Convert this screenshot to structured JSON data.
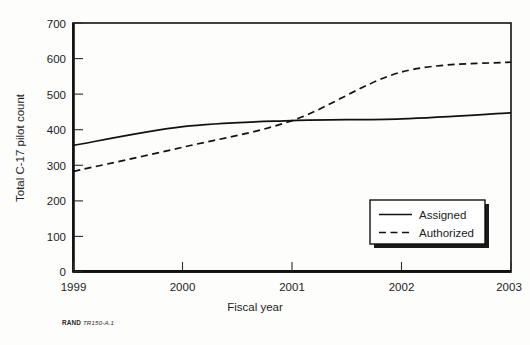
{
  "caption": {
    "publisher": "RAND",
    "document_id": "TR150-A.1"
  },
  "chart_data": {
    "type": "line",
    "title": "",
    "xlabel": "Fiscal year",
    "ylabel": "Total C-17 pilot count",
    "x": [
      1999,
      2000,
      2001,
      2002,
      2003
    ],
    "xticklabels": [
      "1999",
      "2000",
      "2001",
      "2002",
      "2003"
    ],
    "yticks": [
      0,
      100,
      200,
      300,
      400,
      500,
      600,
      700
    ],
    "yticklabels": [
      "0",
      "100",
      "200",
      "300",
      "400",
      "500",
      "600",
      "700"
    ],
    "xlim": [
      1999,
      2003
    ],
    "ylim": [
      0,
      700
    ],
    "grid": false,
    "legend_position": "lower right",
    "series": [
      {
        "name": "Assigned",
        "style": "solid",
        "values": [
          355,
          408,
          425,
          430,
          447
        ]
      },
      {
        "name": "Authorized",
        "style": "dashed",
        "values": [
          282,
          350,
          425,
          562,
          590
        ]
      }
    ]
  }
}
